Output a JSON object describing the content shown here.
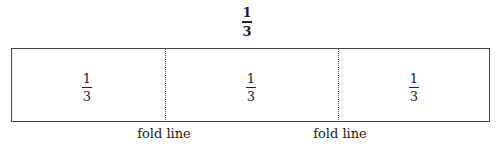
{
  "title_fraction": {
    "numerator": "1",
    "denominator": "3"
  },
  "sections": [
    {
      "numerator": "1",
      "denominator": "3"
    },
    {
      "numerator": "1",
      "denominator": "3"
    },
    {
      "numerator": "1",
      "denominator": "3"
    }
  ],
  "fold_labels": [
    "fold line",
    "fold line"
  ]
}
